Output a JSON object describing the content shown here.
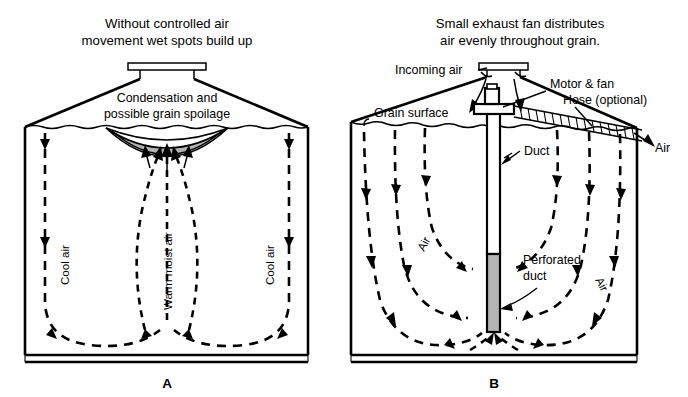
{
  "figure": {
    "background_color": "#ffffff",
    "line_color": "#000000",
    "shade_color": "#b3b3b3"
  },
  "panel_a": {
    "id": "A",
    "title_line1": "Without controlled air",
    "title_line2": "movement wet spots build up",
    "callout_line1": "Condensation and",
    "callout_line2": "possible grain spoilage",
    "label_cool_air_left": "Cool air",
    "label_cool_air_right": "Cool air",
    "label_warm_moist_air": "Warm moist air"
  },
  "panel_b": {
    "id": "B",
    "title_line1": "Small exhaust fan distributes",
    "title_line2": "air evenly throughout grain.",
    "label_incoming_air": "Incoming air",
    "label_motor_fan": "Motor & fan",
    "label_hose_optional": "Hose (optional)",
    "label_grain_surface": "Grain surface",
    "label_duct": "Duct",
    "label_air_exit": "Air",
    "label_perforated_line1": "Perforated",
    "label_perforated_line2": "duct",
    "label_air_left": "Air",
    "label_air_right": "Air"
  }
}
